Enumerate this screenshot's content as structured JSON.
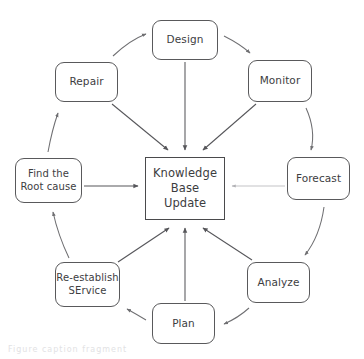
{
  "diagram": {
    "type": "cycle-diagram",
    "center_node": {
      "id": "knowledge-base-update",
      "label": "Knowledge\nBase\nUpdate",
      "shape": "rectangle",
      "border_color": "#4a4a4c"
    },
    "nodes": [
      {
        "id": "design",
        "label": "Design",
        "shape": "rounded-rectangle"
      },
      {
        "id": "monitor",
        "label": "Monitor",
        "shape": "rounded-rectangle"
      },
      {
        "id": "forecast",
        "label": "Forecast",
        "shape": "rounded-rectangle"
      },
      {
        "id": "analyze",
        "label": "Analyze",
        "shape": "rounded-rectangle"
      },
      {
        "id": "plan",
        "label": "Plan",
        "shape": "rounded-rectangle"
      },
      {
        "id": "service",
        "label": "Re-establish\nSErvice",
        "shape": "rounded-rectangle"
      },
      {
        "id": "root",
        "label": "Find the\nRoot cause",
        "shape": "rounded-rectangle"
      },
      {
        "id": "repair",
        "label": "Repair",
        "shape": "rounded-rectangle"
      }
    ],
    "edges": [
      {
        "from": "repair",
        "to": "design",
        "style": "curved"
      },
      {
        "from": "design",
        "to": "monitor",
        "style": "curved"
      },
      {
        "from": "monitor",
        "to": "forecast",
        "style": "curved"
      },
      {
        "from": "forecast",
        "to": "analyze",
        "style": "curved"
      },
      {
        "from": "analyze",
        "to": "plan",
        "style": "curved"
      },
      {
        "from": "plan",
        "to": "service",
        "style": "curved"
      },
      {
        "from": "service",
        "to": "root",
        "style": "curved"
      },
      {
        "from": "root",
        "to": "repair",
        "style": "curved"
      },
      {
        "from": "repair",
        "to": "knowledge-base-update",
        "style": "straight"
      },
      {
        "from": "design",
        "to": "knowledge-base-update",
        "style": "straight"
      },
      {
        "from": "monitor",
        "to": "knowledge-base-update",
        "style": "straight"
      },
      {
        "from": "forecast",
        "to": "knowledge-base-update",
        "style": "straight-light"
      },
      {
        "from": "analyze",
        "to": "knowledge-base-update",
        "style": "straight"
      },
      {
        "from": "plan",
        "to": "knowledge-base-update",
        "style": "straight"
      },
      {
        "from": "service",
        "to": "knowledge-base-update",
        "style": "straight"
      },
      {
        "from": "root",
        "to": "knowledge-base-update",
        "style": "straight"
      }
    ],
    "colors": {
      "background": "#ffffff",
      "node_border": "#59595b",
      "node_fill": "#ffffff",
      "text": "#3d3d3f",
      "edge": "#6f6f72",
      "edge_light": "#b9b9bc"
    },
    "bottom_artifact": "Figure caption fragment"
  }
}
